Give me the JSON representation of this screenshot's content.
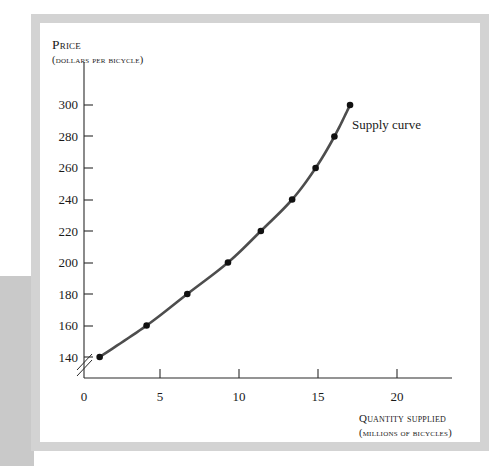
{
  "figure": {
    "background_color": "#ffffff",
    "frame_color": "#d3d3d3",
    "gutter_color": "#c9c9c9"
  },
  "annotations": {
    "supply_curve_label": "Supply curve"
  },
  "axes": {
    "y_title": "Price",
    "y_subtitle": "(dollars per bicycle)",
    "x_title": "Quantity supplied",
    "x_subtitle": "(millions of bicycles)",
    "y_ticks": [
      "140",
      "160",
      "180",
      "200",
      "220",
      "240",
      "260",
      "280",
      "300"
    ],
    "x_ticks": [
      "0",
      "5",
      "10",
      "15",
      "20"
    ],
    "axis_break": true
  },
  "chart_data": {
    "type": "line",
    "title": "",
    "subtitle": "",
    "xlabel": "Quantity supplied (millions of bicycles)",
    "ylabel": "Price (dollars per bicycle)",
    "xlim": [
      0,
      23
    ],
    "ylim": [
      130,
      310
    ],
    "xticks": [
      0,
      5,
      10,
      15,
      20
    ],
    "yticks": [
      140,
      160,
      180,
      200,
      220,
      240,
      260,
      280,
      300
    ],
    "grid": false,
    "legend": "none",
    "y_axis_break": true,
    "line_color": "#4d4d4d",
    "marker_color": "#111111",
    "series": [
      {
        "name": "Supply curve",
        "x": [
          1.0,
          4.0,
          6.6,
          9.2,
          11.3,
          13.3,
          14.8,
          16.0,
          17.0
        ],
        "y": [
          140,
          160,
          180,
          200,
          220,
          240,
          260,
          280,
          300
        ]
      }
    ],
    "annotations": [
      {
        "text": "Supply curve",
        "x": 17.3,
        "y": 292
      }
    ]
  }
}
